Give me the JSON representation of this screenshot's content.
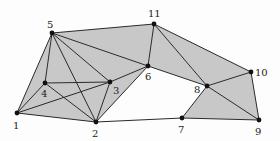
{
  "diagram": {
    "fill_color": "#c8c8c8",
    "edge_color": "#2a2a2a",
    "node_color": "#111111",
    "nodes": [
      {
        "id": "1",
        "label": "1",
        "x": 17,
        "y": 113,
        "lx": 13,
        "ly": 129
      },
      {
        "id": "2",
        "label": "2",
        "x": 96,
        "y": 122,
        "lx": 92,
        "ly": 137
      },
      {
        "id": "3",
        "label": "3",
        "x": 110,
        "y": 82,
        "lx": 113,
        "ly": 94
      },
      {
        "id": "4",
        "label": "4",
        "x": 45,
        "y": 83,
        "lx": 41,
        "ly": 97
      },
      {
        "id": "5",
        "label": "5",
        "x": 52,
        "y": 33,
        "lx": 47,
        "ly": 28
      },
      {
        "id": "6",
        "label": "6",
        "x": 148,
        "y": 66,
        "lx": 145,
        "ly": 80
      },
      {
        "id": "7",
        "label": "7",
        "x": 182,
        "y": 118,
        "lx": 178,
        "ly": 133
      },
      {
        "id": "8",
        "label": "8",
        "x": 207,
        "y": 86,
        "lx": 194,
        "ly": 93
      },
      {
        "id": "9",
        "label": "9",
        "x": 259,
        "y": 120,
        "lx": 255,
        "ly": 135
      },
      {
        "id": "10",
        "label": "10",
        "x": 251,
        "y": 72,
        "lx": 255,
        "ly": 76
      },
      {
        "id": "11",
        "label": "11",
        "x": 154,
        "y": 24,
        "lx": 148,
        "ly": 17
      }
    ],
    "faces": [
      [
        "5",
        "1",
        "4"
      ],
      [
        "5",
        "4",
        "3"
      ],
      [
        "5",
        "3",
        "2"
      ],
      [
        "1",
        "4",
        "2"
      ],
      [
        "4",
        "3",
        "2"
      ],
      [
        "1",
        "2",
        "3"
      ],
      [
        "5",
        "11",
        "6"
      ],
      [
        "5",
        "6",
        "3"
      ],
      [
        "3",
        "6",
        "2"
      ],
      [
        "11",
        "6",
        "8"
      ],
      [
        "11",
        "8",
        "10"
      ],
      [
        "8",
        "10",
        "9"
      ],
      [
        "8",
        "7",
        "9"
      ]
    ],
    "edges": [
      [
        "1",
        "5"
      ],
      [
        "1",
        "4"
      ],
      [
        "1",
        "3"
      ],
      [
        "1",
        "2"
      ],
      [
        "4",
        "5"
      ],
      [
        "4",
        "3"
      ],
      [
        "4",
        "2"
      ],
      [
        "5",
        "3"
      ],
      [
        "5",
        "2"
      ],
      [
        "5",
        "6"
      ],
      [
        "5",
        "11"
      ],
      [
        "3",
        "2"
      ],
      [
        "3",
        "6"
      ],
      [
        "2",
        "6"
      ],
      [
        "2",
        "7"
      ],
      [
        "6",
        "11"
      ],
      [
        "6",
        "8"
      ],
      [
        "11",
        "8"
      ],
      [
        "11",
        "10"
      ],
      [
        "8",
        "10"
      ],
      [
        "8",
        "9"
      ],
      [
        "8",
        "7"
      ],
      [
        "10",
        "9"
      ],
      [
        "7",
        "9"
      ]
    ]
  }
}
